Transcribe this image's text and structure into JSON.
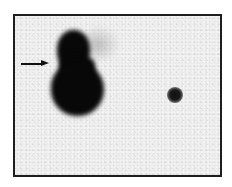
{
  "image": {
    "kind": "grayscale scan",
    "background_color": "#ececec",
    "frame_color": "#1e1e1e",
    "signal_color": "#080808"
  },
  "annotations": {
    "arrow": {
      "direction": "right",
      "color": "#111111"
    }
  },
  "features": [
    {
      "name": "large-bilobed-uptake",
      "lobes": 2,
      "intensity": "high"
    },
    {
      "name": "small-focal-uptake",
      "intensity": "high"
    },
    {
      "name": "faint-diffuse-haze",
      "intensity": "low"
    }
  ]
}
